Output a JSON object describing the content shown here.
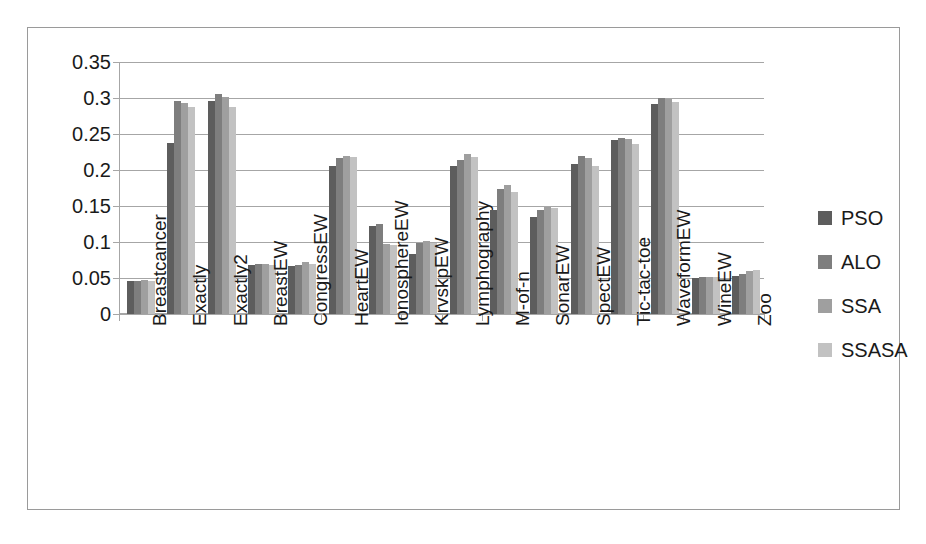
{
  "chart_data": {
    "type": "bar",
    "title": "",
    "subtitle": "",
    "xlabel": "",
    "ylabel": "",
    "ylim": [
      0,
      0.35
    ],
    "ytick_values": [
      0,
      0.05,
      0.1,
      0.15,
      0.2,
      0.25,
      0.3,
      0.35
    ],
    "ytick_labels": [
      "0",
      "0.05",
      "0.1",
      "0.15",
      "0.2",
      "0.25",
      "0.3",
      "0.35"
    ],
    "grid": "horizontal",
    "legend_position": "right",
    "categories": [
      "Breastcancer",
      "Exactly",
      "Exactly2",
      "BreastEW",
      "CongressEW",
      "HeartEW",
      "IonosphereEW",
      "KrvskpEW",
      "Lymphography",
      "M-of-n",
      "SonarEW",
      "SpectEW",
      "Tic-tac-toe",
      "WaveformEW",
      "WineEW",
      "Zoo"
    ],
    "series": [
      {
        "name": "PSO",
        "color": "#5d5d5d",
        "values": [
          0.046,
          0.238,
          0.296,
          0.068,
          0.066,
          0.205,
          0.122,
          0.083,
          0.205,
          0.144,
          0.135,
          0.208,
          0.241,
          0.291,
          0.05,
          0.053
        ]
      },
      {
        "name": "ALO",
        "color": "#7e7e7e",
        "values": [
          0.046,
          0.296,
          0.305,
          0.07,
          0.068,
          0.217,
          0.125,
          0.098,
          0.214,
          0.174,
          0.145,
          0.219,
          0.244,
          0.3,
          0.052,
          0.056
        ]
      },
      {
        "name": "SSA",
        "color": "#9f9f9f",
        "values": [
          0.047,
          0.293,
          0.301,
          0.07,
          0.072,
          0.22,
          0.097,
          0.102,
          0.222,
          0.179,
          0.148,
          0.217,
          0.243,
          0.298,
          0.051,
          0.06
        ]
      },
      {
        "name": "SSASA",
        "color": "#c2c2c2",
        "values": [
          0.046,
          0.288,
          0.287,
          0.068,
          0.069,
          0.218,
          0.096,
          0.098,
          0.218,
          0.17,
          0.147,
          0.205,
          0.236,
          0.295,
          0.051,
          0.061
        ]
      }
    ]
  },
  "legend": {
    "items": [
      {
        "label": "PSO"
      },
      {
        "label": "ALO"
      },
      {
        "label": "SSA"
      },
      {
        "label": "SSASA"
      }
    ]
  }
}
